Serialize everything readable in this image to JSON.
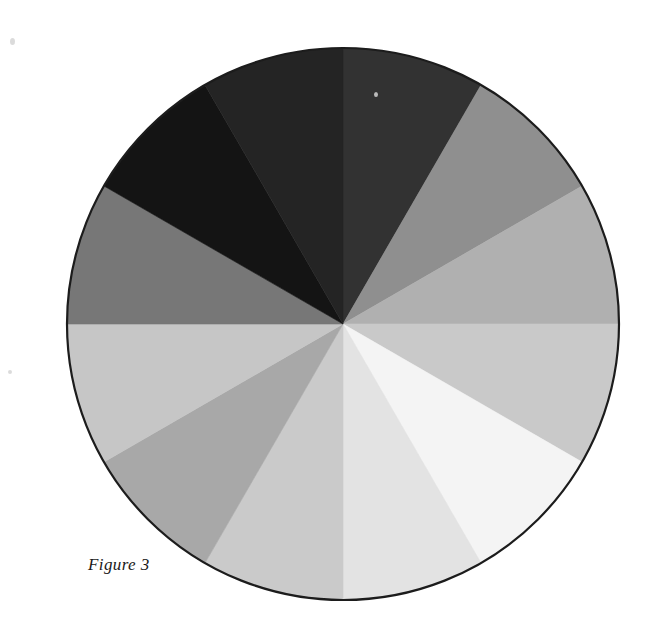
{
  "figure": {
    "caption": "Figure 3",
    "background_color": "#ffffff",
    "outline_color": "#1c1c1c"
  },
  "chart_data": {
    "type": "pie",
    "title": "Figure 3",
    "subtitle": "",
    "xlabel": "",
    "ylabel": "",
    "legend_position": "none",
    "grid": false,
    "center_x": 343,
    "center_y": 324,
    "radius": 276,
    "equal_slices": true,
    "slice_count": 12,
    "slice_angle_degrees": 30,
    "start_angle_degrees": -90,
    "categories": [
      "value-1",
      "value-2",
      "value-3",
      "value-4",
      "value-5",
      "value-6",
      "value-7",
      "value-8",
      "value-9",
      "value-10",
      "value-11",
      "value-12"
    ],
    "values": [
      30,
      30,
      30,
      30,
      30,
      30,
      30,
      30,
      30,
      30,
      30,
      30
    ],
    "percentages": [
      8.33,
      8.33,
      8.33,
      8.33,
      8.33,
      8.33,
      8.33,
      8.33,
      8.33,
      8.33,
      8.33,
      8.33
    ],
    "slices": [
      {
        "index": 1,
        "label": "value-1",
        "start_deg": -90,
        "end_deg": -60,
        "color": "#323232",
        "gray_value": 50,
        "lightness_percent": 20
      },
      {
        "index": 2,
        "label": "value-2",
        "start_deg": -60,
        "end_deg": -30,
        "color": "#8f8f8f",
        "gray_value": 143,
        "lightness_percent": 56
      },
      {
        "index": 3,
        "label": "value-3",
        "start_deg": -30,
        "end_deg": 0,
        "color": "#b0b0b0",
        "gray_value": 176,
        "lightness_percent": 69
      },
      {
        "index": 4,
        "label": "value-4",
        "start_deg": 0,
        "end_deg": 30,
        "color": "#c9c9c9",
        "gray_value": 201,
        "lightness_percent": 79
      },
      {
        "index": 5,
        "label": "value-5",
        "start_deg": 30,
        "end_deg": 60,
        "color": "#f4f4f4",
        "gray_value": 244,
        "lightness_percent": 96
      },
      {
        "index": 6,
        "label": "value-6",
        "start_deg": 60,
        "end_deg": 90,
        "color": "#e3e3e3",
        "gray_value": 227,
        "lightness_percent": 89
      },
      {
        "index": 7,
        "label": "value-7",
        "start_deg": 90,
        "end_deg": 120,
        "color": "#cacaca",
        "gray_value": 202,
        "lightness_percent": 79
      },
      {
        "index": 8,
        "label": "value-8",
        "start_deg": 120,
        "end_deg": 150,
        "color": "#a8a8a8",
        "gray_value": 168,
        "lightness_percent": 66
      },
      {
        "index": 9,
        "label": "value-9",
        "start_deg": 150,
        "end_deg": 180,
        "color": "#c6c6c6",
        "gray_value": 198,
        "lightness_percent": 78
      },
      {
        "index": 10,
        "label": "value-10",
        "start_deg": 180,
        "end_deg": 210,
        "color": "#777777",
        "gray_value": 119,
        "lightness_percent": 47
      },
      {
        "index": 11,
        "label": "value-11",
        "start_deg": 210,
        "end_deg": 240,
        "color": "#141414",
        "gray_value": 20,
        "lightness_percent": 8
      },
      {
        "index": 12,
        "label": "value-12",
        "start_deg": 240,
        "end_deg": 270,
        "color": "#242424",
        "gray_value": 36,
        "lightness_percent": 14
      }
    ]
  }
}
